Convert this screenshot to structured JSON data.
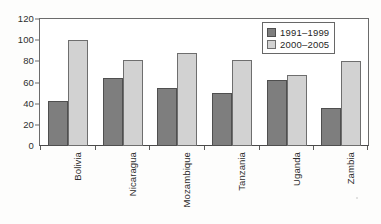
{
  "chart_data": {
    "type": "bar",
    "title": "",
    "xlabel": "",
    "ylabel": "",
    "ylim": [
      0,
      120
    ],
    "ytick_step": 20,
    "yticks": [
      "0",
      "20",
      "40",
      "60",
      "80",
      "100",
      "120"
    ],
    "grid": false,
    "legend_position": "top-right",
    "categories": [
      "Bolivia",
      "Nicaragua",
      "Mozambique",
      "Tanzania",
      "Uganda",
      "Zambia"
    ],
    "series": [
      {
        "name": "1991–1999",
        "color": "#7e7e7e",
        "values": [
          43,
          64,
          55,
          50,
          62,
          36
        ]
      },
      {
        "name": "2000–2005",
        "color": "#d2d2d2",
        "values": [
          100,
          81,
          88,
          81,
          67,
          80
        ]
      }
    ]
  },
  "legend": {
    "entries": [
      {
        "label": "1991–1999",
        "swatch": "legend-swatch-series-1"
      },
      {
        "label": "2000–2005",
        "swatch": "legend-swatch-series-2"
      }
    ]
  },
  "axes": {
    "y_tick_labels": [
      "120",
      "100",
      "80",
      "60",
      "40",
      "20",
      "0"
    ],
    "x_tick_labels": [
      "Bolivia",
      "Nicaragua",
      "Mozambique",
      "Tanzania",
      "Uganda",
      "Zambia"
    ]
  }
}
